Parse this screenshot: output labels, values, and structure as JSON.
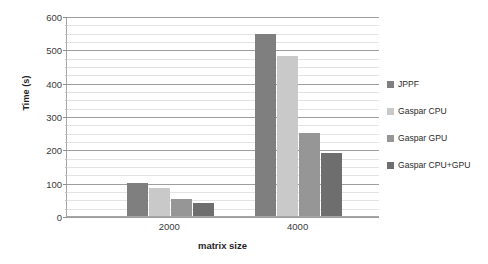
{
  "chart_data": {
    "type": "bar",
    "title": "",
    "xlabel": "matrix size",
    "ylabel": "Time (s)",
    "categories": [
      "2000",
      "4000"
    ],
    "series": [
      {
        "name": "JPPF",
        "color": "#7f7f7f",
        "values": [
          100,
          545
        ]
      },
      {
        "name": "Gaspar CPU",
        "color": "#c9c9c9",
        "values": [
          85,
          481
        ]
      },
      {
        "name": "Gaspar GPU",
        "color": "#969696",
        "values": [
          50,
          250
        ]
      },
      {
        "name": "Gaspar CPU+GPU",
        "color": "#6e6e6e",
        "values": [
          38,
          190
        ]
      }
    ],
    "ylim": [
      0,
      600
    ],
    "y_major_ticks": [
      0,
      100,
      200,
      300,
      400,
      500,
      600
    ],
    "y_minor_step": 25,
    "y_tick_labels": [
      "600",
      "500",
      "400",
      "300",
      "200",
      "100",
      "0"
    ],
    "grid": true,
    "legend_position": "right",
    "axis_color": "#a6a6a6",
    "gridline_color": "#e3e3e3",
    "major_gridline_color": "#9d9d9d"
  },
  "axes": {
    "y_title": "Time (s)",
    "x_title": "matrix size"
  },
  "legend": {
    "items": [
      {
        "label": "JPPF"
      },
      {
        "label": "Gaspar CPU"
      },
      {
        "label": "Gaspar GPU"
      },
      {
        "label": "Gaspar CPU+GPU"
      }
    ]
  }
}
